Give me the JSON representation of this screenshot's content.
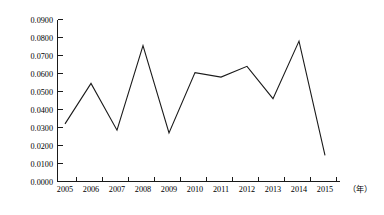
{
  "chart_data": {
    "type": "line",
    "title": "",
    "xlabel": "（年）",
    "ylabel": "",
    "x": [
      "2005",
      "2006",
      "2007",
      "2008",
      "2009",
      "2010",
      "2011",
      "2012",
      "2013",
      "2014",
      "2015"
    ],
    "categories": [
      "2005",
      "2006",
      "2007",
      "2008",
      "2009",
      "2010",
      "2011",
      "2012",
      "2013",
      "2014",
      "2015"
    ],
    "values": [
      0.032,
      0.0545,
      0.0285,
      0.0755,
      0.027,
      0.0605,
      0.058,
      0.064,
      0.046,
      0.078,
      0.0145
    ],
    "series": [
      {
        "name": "",
        "values": [
          0.032,
          0.0545,
          0.0285,
          0.0755,
          0.027,
          0.0605,
          0.058,
          0.064,
          0.046,
          0.078,
          0.0145
        ]
      }
    ],
    "ylim": [
      0.0,
      0.09
    ],
    "yticks": [
      0.0,
      0.01,
      0.02,
      0.03,
      0.04,
      0.05,
      0.06,
      0.07,
      0.08,
      0.09
    ],
    "ytick_labels": [
      "0.0000",
      "0.0100",
      "0.0200",
      "0.0300",
      "0.0400",
      "0.0500",
      "0.0600",
      "0.0700",
      "0.0800",
      "0.0900"
    ],
    "xtick_labels": [
      "2005",
      "2006",
      "2007",
      "2008",
      "2009",
      "2010",
      "2011",
      "2012",
      "2013",
      "2014",
      "2015"
    ],
    "grid": false,
    "legend": false,
    "legend_position": "none",
    "line_color": "#1a1a1a",
    "axis_color": "#1a1a1a",
    "background_color": "#ffffff"
  },
  "axis_labels": {
    "y": {
      "t0": "0.0900",
      "t1": "0.0800",
      "t2": "0.0700",
      "t3": "0.0600",
      "t4": "0.0500",
      "t5": "0.0400",
      "t6": "0.0300",
      "t7": "0.0200",
      "t8": "0.0100",
      "t9": "0.0000"
    },
    "x": {
      "t0": "2005",
      "t1": "2006",
      "t2": "2007",
      "t3": "2008",
      "t4": "2009",
      "t5": "2010",
      "t6": "2011",
      "t7": "2012",
      "t8": "2013",
      "t9": "2014",
      "t10": "2015",
      "unit": "（年）"
    }
  }
}
